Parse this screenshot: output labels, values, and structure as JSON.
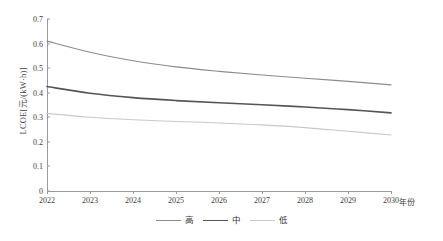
{
  "chart_data": {
    "type": "line",
    "title": "",
    "xlabel": "年份",
    "ylabel": "LCOE[元/(kW·h)]",
    "x": [
      2022,
      2023,
      2024,
      2025,
      2026,
      2027,
      2028,
      2029,
      2030
    ],
    "categories": [
      "2022",
      "2023",
      "2024",
      "2025",
      "2026",
      "2027",
      "2028",
      "2029",
      "2030"
    ],
    "xlim": [
      2022,
      2030
    ],
    "ylim": [
      0,
      0.7
    ],
    "yticks": [
      "0",
      "0.1",
      "0.2",
      "0.3",
      "0.4",
      "0.5",
      "0.6",
      "0.7"
    ],
    "ytick_values": [
      0,
      0.1,
      0.2,
      0.3,
      0.4,
      0.5,
      0.6,
      0.7
    ],
    "grid": false,
    "legend_position": "bottom",
    "series": [
      {
        "name": "高",
        "color": "#8c8c8c",
        "width": 1.1,
        "values": [
          0.61,
          0.565,
          0.53,
          0.505,
          0.487,
          0.472,
          0.459,
          0.446,
          0.432
        ]
      },
      {
        "name": "中",
        "color": "#555555",
        "width": 1.6,
        "values": [
          0.425,
          0.398,
          0.38,
          0.368,
          0.359,
          0.351,
          0.342,
          0.331,
          0.318
        ]
      },
      {
        "name": "低",
        "color": "#c9c9c9",
        "width": 1.1,
        "values": [
          0.316,
          0.3,
          0.29,
          0.283,
          0.277,
          0.269,
          0.258,
          0.243,
          0.228
        ]
      }
    ]
  },
  "axes": {
    "frame_color": "#9a9a9a",
    "text_color": "#3d3d3d"
  }
}
